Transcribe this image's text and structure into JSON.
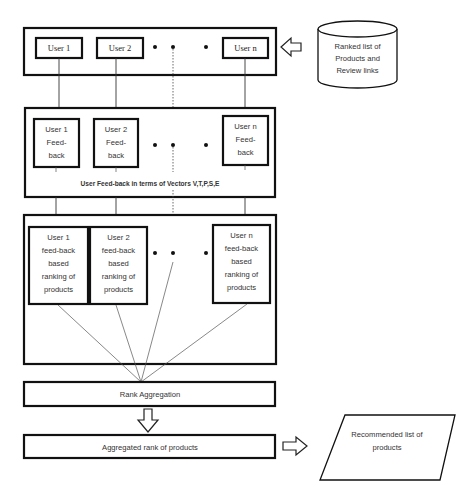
{
  "diagram": {
    "top_row": {
      "users": [
        "User 1",
        "User 2",
        "User n"
      ],
      "ellipsis": "• • •"
    },
    "source": {
      "shape": "cylinder",
      "lines": [
        "Ranked list of",
        "Products and",
        "Review links"
      ]
    },
    "feedback_row": {
      "boxes": [
        {
          "lines": [
            "User 1",
            "Feed-",
            "back"
          ]
        },
        {
          "lines": [
            "User 2",
            "Feed-",
            "back"
          ]
        },
        {
          "lines": [
            "User n",
            "Feed-",
            "back"
          ]
        }
      ],
      "caption": "User Feed-back in terms of Vectors V,T,P,S,E"
    },
    "ranking_row": {
      "boxes": [
        {
          "lines": [
            "User 1",
            "feed-back",
            "based",
            "ranking of",
            "products"
          ]
        },
        {
          "lines": [
            "User 2",
            "feed-back",
            "based",
            "ranking of",
            "products"
          ]
        },
        {
          "lines": [
            "User n",
            "feed-back",
            "based",
            "ranking of",
            "products"
          ]
        }
      ]
    },
    "rank_aggregation": "Rank Aggregation",
    "aggregated_rank": "Aggregated rank of products",
    "output": {
      "shape": "parallelogram",
      "lines": [
        "Recommended list of",
        "products"
      ]
    }
  }
}
